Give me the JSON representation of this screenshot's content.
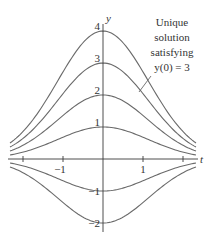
{
  "chart_data": {
    "type": "line",
    "title": "",
    "xlabel": "t",
    "ylabel": "y",
    "xlim": [
      -2.3,
      2.3
    ],
    "ylim": [
      -2.1,
      4.2
    ],
    "grid": false,
    "legend": null,
    "x_ticks": [
      {
        "value": -2,
        "label": ""
      },
      {
        "value": -1,
        "label": "−1"
      },
      {
        "value": 1,
        "label": "1"
      },
      {
        "value": 2,
        "label": ""
      }
    ],
    "y_ticks": [
      {
        "value": 4,
        "label": "4"
      },
      {
        "value": 3,
        "label": "3"
      },
      {
        "value": 2,
        "label": "2"
      },
      {
        "value": 1,
        "label": "1"
      },
      {
        "value": -1,
        "label": "−1"
      },
      {
        "value": -2,
        "label": "−2"
      }
    ],
    "curve_formula": "y = C·exp(-0.385·t²)",
    "decay_k": 0.385,
    "series": [
      {
        "name": "y(0) = 4",
        "C": 4
      },
      {
        "name": "y(0) = 3",
        "C": 3,
        "highlighted": true
      },
      {
        "name": "y(0) = 2",
        "C": 2
      },
      {
        "name": "y(0) = 1",
        "C": 1
      },
      {
        "name": "y(0) = −1",
        "C": -1
      },
      {
        "name": "y(0) = −2",
        "C": -2
      }
    ],
    "annotations": [
      {
        "lines": [
          "Unique",
          "solution",
          "satisfying",
          "y(0) = 3"
        ],
        "target_series": "y(0) = 3"
      }
    ]
  },
  "layout": {
    "origin_px": [
      103,
      159
    ],
    "px_per_t": 40,
    "px_per_y": 32,
    "x_start_px": 10,
    "x_end_px": 196
  }
}
